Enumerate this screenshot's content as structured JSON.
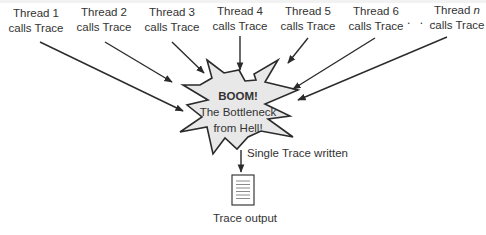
{
  "diagram": {
    "threads": [
      {
        "line1": "Thread 1",
        "line2": "calls Trace"
      },
      {
        "line1": "Thread 2",
        "line2": "calls Trace"
      },
      {
        "line1": "Thread 3",
        "line2": "calls Trace"
      },
      {
        "line1": "Thread 4",
        "line2": "calls Trace"
      },
      {
        "line1": "Thread 5",
        "line2": "calls Trace"
      },
      {
        "line1": "Thread 6",
        "line2": "calls Trace"
      },
      {
        "line1_prefix": "Thread ",
        "line1_var": "n",
        "line2": "calls Trace"
      }
    ],
    "ellipsis": ". . .",
    "bottleneck": {
      "title": "BOOM!",
      "line2": "The Bottleneck",
      "line3": "from Hell!"
    },
    "edge_label": "Single Trace written",
    "output_label": "Trace output",
    "colors": {
      "burst_fill": "#e8e8e8",
      "stroke": "#2b2b2b",
      "doc_lines": "#8a8a8a"
    }
  }
}
